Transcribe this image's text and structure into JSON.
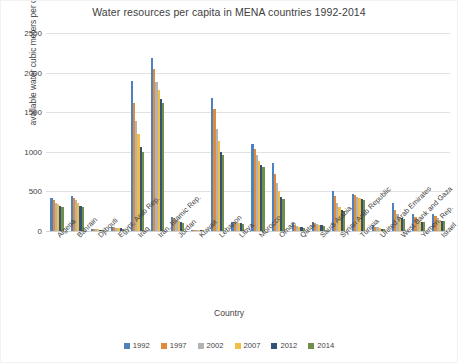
{
  "chart_data": {
    "type": "bar",
    "title": "Water resources per capita in MENA countries  1992-2014",
    "xlabel": "Country",
    "ylabel": "available water cubic meters per capita",
    "ylim": [
      0,
      2500
    ],
    "yticks": [
      2500,
      2000,
      1500,
      1000,
      500,
      0
    ],
    "ytick_labels": [
      "2500",
      "2000",
      "1500",
      "1000",
      "500",
      "0"
    ],
    "grid": true,
    "legend_position": "bottom",
    "categories": [
      "Algeria",
      "Bahrain",
      "Djibouti",
      "Egypt, Arab Rep.",
      "Iraq",
      "Iran, Islamic Rep.",
      "Jordan",
      "Kuwait",
      "Lebanon",
      "Libya",
      "Morocco",
      "Oman",
      "Qatar",
      "Saudi Arabia",
      "Syrian Arab Republic",
      "Tunisia",
      "United Arab Emirates",
      "West Bank and Gaza",
      "Yemen, Rep.",
      "Israel"
    ],
    "series": [
      {
        "name": "1992",
        "color": "#4f81bd",
        "values": [
          420,
          440,
          30,
          50,
          1900,
          2190,
          180,
          10,
          1680,
          120,
          1100,
          860,
          100,
          110,
          510,
          470,
          70,
          350,
          210,
          220
        ]
      },
      {
        "name": "1997",
        "color": "#e08a3c",
        "values": [
          390,
          420,
          25,
          45,
          1620,
          2040,
          160,
          10,
          1540,
          110,
          1030,
          720,
          80,
          95,
          440,
          450,
          55,
          260,
          180,
          190
        ]
      },
      {
        "name": "2002",
        "color": "#b3b3b3",
        "values": [
          360,
          390,
          22,
          40,
          1390,
          1880,
          140,
          10,
          1290,
          105,
          960,
          600,
          65,
          85,
          350,
          430,
          45,
          210,
          150,
          165
        ]
      },
      {
        "name": "2007",
        "color": "#f2bd45",
        "values": [
          335,
          360,
          20,
          35,
          1220,
          1780,
          125,
          10,
          1140,
          100,
          890,
          500,
          55,
          75,
          300,
          415,
          35,
          180,
          130,
          145
        ]
      },
      {
        "name": "2012",
        "color": "#32527a",
        "values": [
          310,
          320,
          18,
          32,
          1060,
          1670,
          110,
          10,
          1000,
          95,
          830,
          430,
          45,
          70,
          265,
          400,
          28,
          160,
          115,
          130
        ]
      },
      {
        "name": "2014",
        "color": "#6f8f4a",
        "values": [
          300,
          305,
          17,
          30,
          1000,
          1620,
          105,
          10,
          960,
          92,
          810,
          405,
          42,
          68,
          250,
          395,
          25,
          150,
          110,
          125
        ]
      }
    ]
  }
}
